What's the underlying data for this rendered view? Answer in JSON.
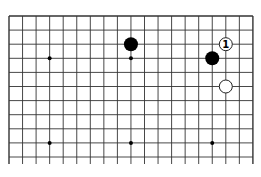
{
  "diagram": {
    "type": "go-board-fragment",
    "columns": 19,
    "rows_shown": 11,
    "open_bottom": true,
    "colors": {
      "line": "#333333",
      "black_stone": "#000000",
      "white_stone": "#ffffff",
      "background": "#ffffff"
    },
    "star_points": [
      {
        "col": 3,
        "row": 3
      },
      {
        "col": 9,
        "row": 3
      },
      {
        "col": 15,
        "row": 3
      },
      {
        "col": 3,
        "row": 9
      },
      {
        "col": 9,
        "row": 9
      },
      {
        "col": 15,
        "row": 9
      }
    ],
    "stones": [
      {
        "color": "black",
        "col": 9,
        "row": 2,
        "label": ""
      },
      {
        "color": "black",
        "col": 15,
        "row": 3,
        "label": ""
      },
      {
        "color": "white",
        "col": 16,
        "row": 2,
        "label": "1"
      },
      {
        "color": "white",
        "col": 16,
        "row": 5,
        "label": ""
      }
    ]
  }
}
